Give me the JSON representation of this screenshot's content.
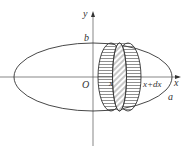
{
  "diagram": {
    "axes": {
      "x_label": "x",
      "y_label": "y",
      "origin_label": "O"
    },
    "ellipse_labels": {
      "semi_minor": "b",
      "semi_major": "a"
    },
    "slab_labels": {
      "left": "x",
      "right": "x+dx"
    },
    "colors": {
      "stroke": "#333333",
      "background": "#ffffff"
    }
  }
}
